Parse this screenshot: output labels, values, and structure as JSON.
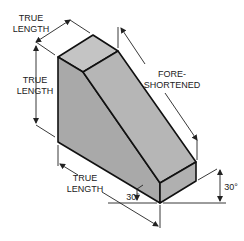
{
  "diagram": {
    "type": "isometric-drawing",
    "colors": {
      "background": "#ffffff",
      "face_top": "#c4c4c4",
      "face_left": "#a9a9a9",
      "face_slope": "#b6b6b6",
      "face_front": "#b0b0b0",
      "edge": "#111111",
      "dimension": "#222222"
    },
    "labels": {
      "top_true_length_1": "TRUE",
      "top_true_length_2": "LENGTH",
      "left_true_length_1": "TRUE",
      "left_true_length_2": "LENGTH",
      "bottom_true_length_1": "TRUE",
      "bottom_true_length_2": "LENGTH",
      "foreshortened_1": "FORE-",
      "foreshortened_2": "SHORTENED",
      "angle_left": "30°",
      "angle_right": "30°"
    }
  }
}
